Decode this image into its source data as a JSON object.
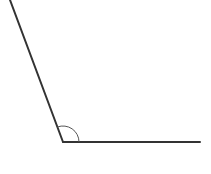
{
  "diagram": {
    "type": "angle",
    "vertex": {
      "x": 63,
      "y": 142
    },
    "ray_left": {
      "x1": 63,
      "y1": 142,
      "x2": 10,
      "y2": 0
    },
    "ray_right": {
      "x1": 63,
      "y1": 142,
      "x2": 200,
      "y2": 142
    },
    "arc": {
      "radius": 16
    },
    "stroke_color": "#333333",
    "arc_color": "#555555",
    "background": "#ffffff"
  }
}
